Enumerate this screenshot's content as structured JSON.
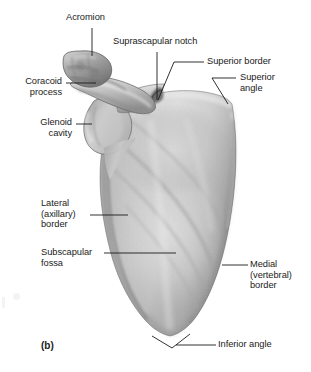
{
  "figure": {
    "panel_label": "(b)",
    "subject": "scapula",
    "view": "anterior (costal) view",
    "background_color": "#ffffff",
    "text_color": "#1b1b1b",
    "bone_color_light": "#dedede",
    "bone_color_mid": "#bfbfbf",
    "bone_color_dark": "#8f8f8f",
    "leader_color": "#1b1b1b"
  },
  "labels": [
    {
      "id": "acromion",
      "text": "Acromion",
      "lines": [
        "Acromion"
      ]
    },
    {
      "id": "suprascapular-notch",
      "text": "Suprascapular notch",
      "lines": [
        "Suprascapular notch"
      ]
    },
    {
      "id": "superior-border",
      "text": "Superior border",
      "lines": [
        "Superior border"
      ]
    },
    {
      "id": "superior-angle",
      "text": "Superior angle",
      "lines": [
        "Superior",
        "angle"
      ]
    },
    {
      "id": "coracoid-process",
      "text": "Coracoid process",
      "lines": [
        "Coracoid",
        "process"
      ]
    },
    {
      "id": "glenoid-cavity",
      "text": "Glenoid cavity",
      "lines": [
        "Glenoid",
        "cavity"
      ]
    },
    {
      "id": "lateral-border",
      "text": "Lateral (axillary) border",
      "lines": [
        "Lateral",
        "(axillary)",
        "border"
      ]
    },
    {
      "id": "subscapular-fossa",
      "text": "Subscapular fossa",
      "lines": [
        "Subscapular",
        "fossa"
      ]
    },
    {
      "id": "medial-border",
      "text": "Medial (vertebral) border",
      "lines": [
        "Medial",
        "(vertebral)",
        "border"
      ]
    },
    {
      "id": "inferior-angle",
      "text": "Inferior angle",
      "lines": [
        "Inferior angle"
      ]
    }
  ],
  "label_text": {
    "acromion": "Acromion",
    "suprascapular_notch": "Suprascapular notch",
    "superior_border": "Superior border",
    "superior_angle_l1": "Superior",
    "superior_angle_l2": "angle",
    "coracoid_l1": "Coracoid",
    "coracoid_l2": "process",
    "glenoid_l1": "Glenoid",
    "glenoid_l2": "cavity",
    "lateral_l1": "Lateral",
    "lateral_l2": "(axillary)",
    "lateral_l3": "border",
    "subscapular_l1": "Subscapular",
    "subscapular_l2": "fossa",
    "medial_l1": "Medial",
    "medial_l2": "(vertebral)",
    "medial_l3": "border",
    "inferior_angle": "Inferior angle",
    "panel": "(b)"
  }
}
